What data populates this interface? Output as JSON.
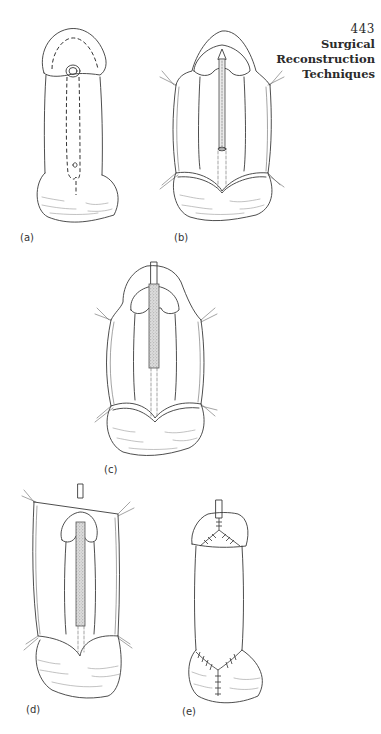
{
  "page": {
    "number": "443",
    "running_title_line1": "Surgical",
    "running_title_line2": "Reconstruction",
    "running_title_line3": "Techniques"
  },
  "figures": [
    {
      "id": "a",
      "label": "(a)",
      "description": "Penile outline with dashed incision line from glans meatus down ventral shaft to scrotum"
    },
    {
      "id": "b",
      "label": "(b)",
      "description": "Skin flaps retracted with stay sutures, urethral plate with catheter exposed"
    },
    {
      "id": "c",
      "label": "(c)",
      "description": "Graft tube placed over catheter on shaft with retracted skin flaps"
    },
    {
      "id": "d",
      "label": "(d)",
      "description": "Skin flap mobilized upward and held with stay sutures; graft over catheter"
    },
    {
      "id": "e",
      "label": "(e)",
      "description": "Completed repair with suture lines at glans and penoscrotal junction; catheter in place"
    }
  ]
}
